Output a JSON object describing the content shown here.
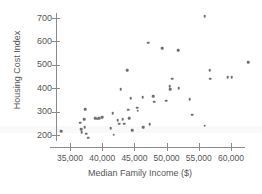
{
  "chart_data": {
    "type": "scatter",
    "title": "",
    "xlabel": "Median Family Income ($)",
    "ylabel": "Housing Cost Index",
    "xlim": [
      33000,
      64500
    ],
    "ylim": [
      170,
      730
    ],
    "grid": false,
    "legend": null,
    "xticks": [
      35000,
      40000,
      45000,
      50000,
      55000,
      60000
    ],
    "xtick_labels": [
      "35,000",
      "40,000",
      "45,000",
      "50,000",
      "55,000",
      "60,000"
    ],
    "yticks": [
      200,
      300,
      400,
      500,
      600,
      700
    ],
    "ytick_labels": [
      "200",
      "300",
      "400",
      "500",
      "600",
      "700"
    ],
    "marker_color": "#6f6f6f",
    "axis_color": "#8a8a8a",
    "points": [
      {
        "x": 33600,
        "y": 217
      },
      {
        "x": 36600,
        "y": 252
      },
      {
        "x": 36700,
        "y": 226
      },
      {
        "x": 36800,
        "y": 213
      },
      {
        "x": 37200,
        "y": 268
      },
      {
        "x": 37300,
        "y": 233
      },
      {
        "x": 37400,
        "y": 311
      },
      {
        "x": 37500,
        "y": 206
      },
      {
        "x": 37800,
        "y": 188
      },
      {
        "x": 38900,
        "y": 272
      },
      {
        "x": 39200,
        "y": 270
      },
      {
        "x": 39500,
        "y": 273
      },
      {
        "x": 40000,
        "y": 276
      },
      {
        "x": 41300,
        "y": 228
      },
      {
        "x": 41600,
        "y": 294
      },
      {
        "x": 41800,
        "y": 201
      },
      {
        "x": 42400,
        "y": 262
      },
      {
        "x": 42600,
        "y": 249
      },
      {
        "x": 42900,
        "y": 395
      },
      {
        "x": 43200,
        "y": 268
      },
      {
        "x": 43400,
        "y": 249
      },
      {
        "x": 43900,
        "y": 476
      },
      {
        "x": 44000,
        "y": 308
      },
      {
        "x": 44200,
        "y": 272
      },
      {
        "x": 44400,
        "y": 358
      },
      {
        "x": 44700,
        "y": 221
      },
      {
        "x": 45400,
        "y": 316
      },
      {
        "x": 45500,
        "y": 304
      },
      {
        "x": 46300,
        "y": 362
      },
      {
        "x": 46400,
        "y": 234
      },
      {
        "x": 47100,
        "y": 595
      },
      {
        "x": 47400,
        "y": 245
      },
      {
        "x": 47900,
        "y": 367
      },
      {
        "x": 48100,
        "y": 342
      },
      {
        "x": 49300,
        "y": 570
      },
      {
        "x": 49900,
        "y": 347
      },
      {
        "x": 50500,
        "y": 408
      },
      {
        "x": 50600,
        "y": 396
      },
      {
        "x": 50900,
        "y": 441
      },
      {
        "x": 51800,
        "y": 563
      },
      {
        "x": 51900,
        "y": 400
      },
      {
        "x": 53600,
        "y": 354
      },
      {
        "x": 54000,
        "y": 287
      },
      {
        "x": 55900,
        "y": 707
      },
      {
        "x": 55900,
        "y": 240
      },
      {
        "x": 56700,
        "y": 477
      },
      {
        "x": 56800,
        "y": 440
      },
      {
        "x": 59500,
        "y": 447
      },
      {
        "x": 60100,
        "y": 447
      },
      {
        "x": 62700,
        "y": 511
      }
    ]
  }
}
